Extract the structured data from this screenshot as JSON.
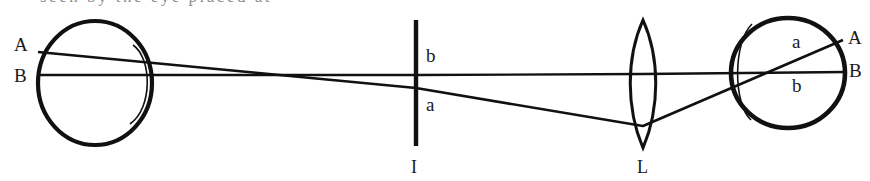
{
  "figure": {
    "type": "optical-ray-diagram",
    "title_fragment_cut_off_at_top": "seen by the eye placed at",
    "background_color": "#ffffff",
    "ink_color": "#111111",
    "stroke_widths": {
      "outline": 3.2,
      "ray": 2.0,
      "cornea": 1.3
    },
    "labels": {
      "left_eye_upper": "A",
      "left_eye_lower": "B",
      "object_upper": "b",
      "object_lower": "a",
      "object_name": "I",
      "lens_name": "L",
      "right_eye_inner_upper": "a",
      "right_eye_inner_lower": "b",
      "right_eye_outer_upper": "A",
      "right_eye_outer_lower": "B"
    },
    "elements": [
      {
        "name": "left-eye",
        "kind": "eyeball",
        "cx": 95,
        "cy": 83,
        "rx": 57,
        "ry": 62,
        "cornea_side": "right"
      },
      {
        "name": "object-bar",
        "kind": "vertical-bar",
        "x": 416,
        "y1": 20,
        "y2": 146
      },
      {
        "name": "lens",
        "kind": "biconvex-lens",
        "cx": 643,
        "y1": 20,
        "y2": 148,
        "bulge": 14
      },
      {
        "name": "right-eye",
        "kind": "eyeball",
        "cx": 788,
        "cy": 73,
        "rx": 57,
        "ry": 55,
        "cornea_side": "left"
      }
    ],
    "rays": [
      {
        "name": "ray-upper-A",
        "points": "38,52 416,88 643,125 843,40"
      },
      {
        "name": "ray-axis-B",
        "points": "38,75 416,75 643,75 845,72"
      }
    ]
  }
}
